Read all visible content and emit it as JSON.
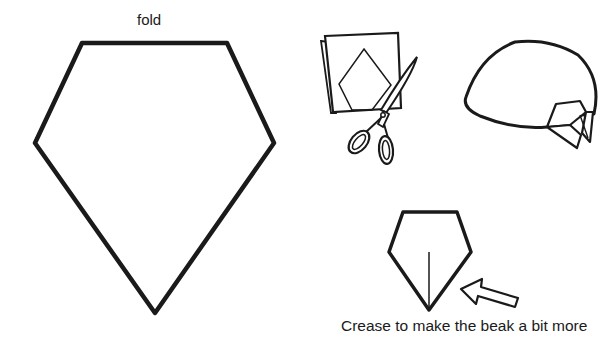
{
  "diagram": {
    "labels": {
      "fold": "fold",
      "caption": "Crease to make the beak a bit more"
    },
    "colors": {
      "stroke": "#1a1a1a",
      "background": "#ffffff"
    },
    "figures": [
      {
        "id": "pentagon-template",
        "description": "Large pentagon template with fold edge on top"
      },
      {
        "id": "cutting-illustration",
        "description": "Folded paper with pentagon outline and scissors cutting"
      },
      {
        "id": "bird-head",
        "description": "Finished rounded head shape with folded beak"
      },
      {
        "id": "beak-crease",
        "description": "Small pentagon with crease line and arrow"
      }
    ]
  }
}
